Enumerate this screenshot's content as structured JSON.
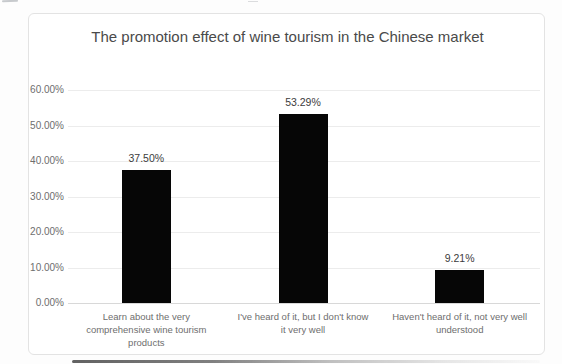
{
  "chart_data": {
    "type": "bar",
    "title": "The promotion effect of wine tourism in the Chinese market",
    "categories": [
      "Learn about the very comprehensive wine tourism products",
      "I've heard of it, but I don't know it very well",
      "Haven't heard of it, not very well understood"
    ],
    "category_lines": [
      [
        "Learn about the very",
        "comprehensive wine tourism",
        "products"
      ],
      [
        "I've heard of it, but I don't know",
        "it very well"
      ],
      [
        "Haven't heard of it, not very well",
        "understood"
      ]
    ],
    "values": [
      37.5,
      53.29,
      9.21
    ],
    "data_labels": [
      "37.50%",
      "53.29%",
      "9.21%"
    ],
    "y_ticks": [
      "0.00%",
      "10.00%",
      "20.00%",
      "30.00%",
      "40.00%",
      "50.00%",
      "60.00%"
    ],
    "ylim": [
      0,
      60
    ],
    "xlabel": "",
    "ylabel": "",
    "grid": true,
    "legend": "none",
    "series_name": ""
  },
  "colors": {
    "bar": "#060606",
    "gridline": "#ececec",
    "baseline": "#d8d8d8",
    "title_text": "#4a4a4a",
    "axis_text": "#6e6e6e",
    "data_label_text": "#3c3c3c",
    "chart_border": "#e3e3e3",
    "background": "#ffffff"
  }
}
